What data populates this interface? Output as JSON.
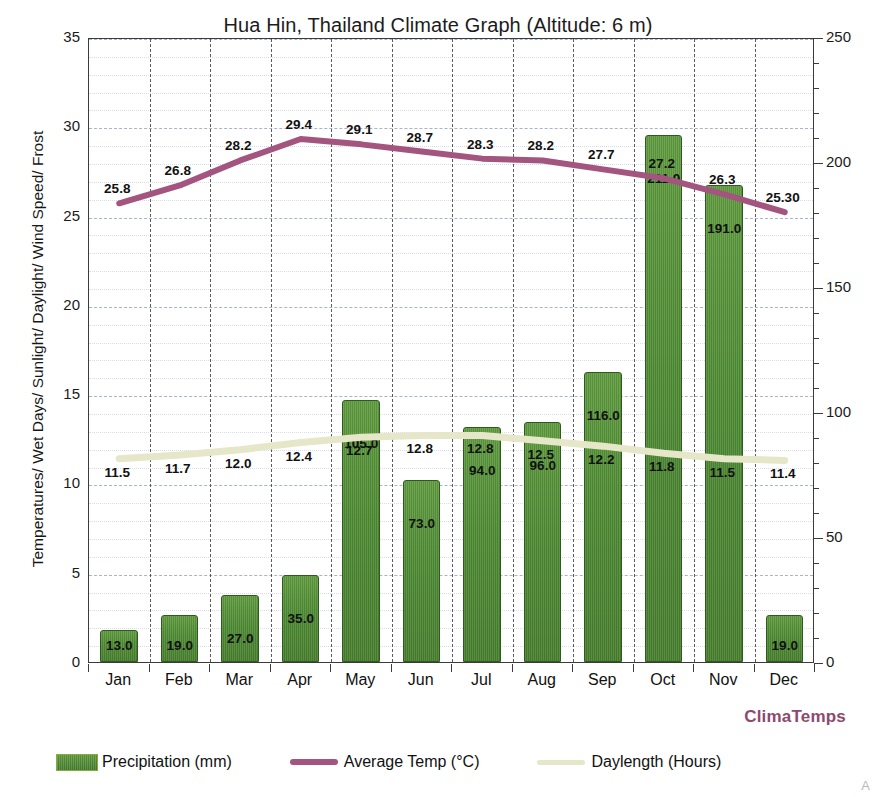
{
  "chart_data": {
    "type": "bar",
    "title": "Hua Hin, Thailand Climate Graph (Altitude: 6 m)",
    "categories": [
      "Jan",
      "Feb",
      "Mar",
      "Apr",
      "May",
      "Jun",
      "Jul",
      "Aug",
      "Sep",
      "Oct",
      "Nov",
      "Dec"
    ],
    "ylabel": "Temperatures/ Wet Days/ Sunlight/ Daylight/ Wind Speed/ Frost",
    "ylabel_right": "Relative Humidity/ Precipitation",
    "xlabel": "",
    "ylim": [
      0,
      35
    ],
    "ylim_right": [
      0,
      250
    ],
    "yticks": [
      0,
      5,
      10,
      15,
      20,
      25,
      30,
      35
    ],
    "yticks_right": [
      0,
      50,
      100,
      150,
      200,
      250
    ],
    "grid": true,
    "legend_position": "bottom",
    "series": [
      {
        "name": "Precipitation (mm)",
        "type": "bar",
        "axis": "right",
        "unit": "mm",
        "color": "#4e8b33",
        "values": [
          13.0,
          19.0,
          27.0,
          35.0,
          105.0,
          73.0,
          94.0,
          96.0,
          116.0,
          211.0,
          191.0,
          19.0
        ],
        "labels": [
          "13.0",
          "19.0",
          "27.0",
          "35.0",
          "105.0",
          "73.0",
          "94.0",
          "96.0",
          "116.0",
          "211.0",
          "191.0",
          "19.0"
        ]
      },
      {
        "name": "Average Temp (°C)",
        "type": "line",
        "axis": "left",
        "unit": "°C",
        "color": "#a35580",
        "values": [
          25.8,
          26.8,
          28.2,
          29.4,
          29.1,
          28.7,
          28.3,
          28.2,
          27.7,
          27.2,
          26.3,
          25.3
        ],
        "labels": [
          "25.8",
          "26.8",
          "28.2",
          "29.4",
          "29.1",
          "28.7",
          "28.3",
          "28.2",
          "27.7",
          "27.2",
          "26.3",
          "25.30"
        ]
      },
      {
        "name": "Daylength (Hours)",
        "type": "line",
        "axis": "left",
        "unit": "Hours",
        "color": "#e6e7c9",
        "values": [
          11.5,
          11.7,
          12.0,
          12.4,
          12.7,
          12.8,
          12.8,
          12.5,
          12.2,
          11.8,
          11.5,
          11.4
        ],
        "labels": [
          "11.5",
          "11.7",
          "12.0",
          "12.4",
          "12.7",
          "12.8",
          "12.8",
          "12.5",
          "12.2",
          "11.8",
          "11.5",
          "11.4"
        ]
      }
    ]
  },
  "legend": {
    "items": [
      {
        "label": "Precipitation (mm)",
        "swatch": "bar"
      },
      {
        "label": "Average Temp (°C)",
        "swatch": "line"
      },
      {
        "label": "Daylength (Hours)",
        "swatch": "line-daylength"
      }
    ]
  },
  "branding": {
    "watermark": "ClimaTemps",
    "corner_mark": "A"
  }
}
